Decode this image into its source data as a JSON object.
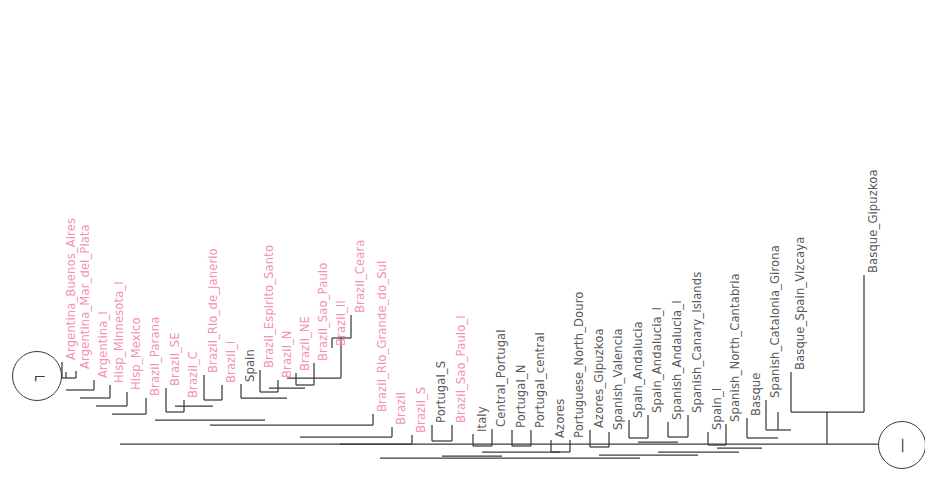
{
  "figure": {
    "orientation": "rotated-90",
    "background_color": "#ffffff",
    "branch_color": "#3a3a3a",
    "colors": {
      "clade_pink": "#f58fb4",
      "clade_grey": "#58585a",
      "branch": "#3a3a3a",
      "badge_border": "#3a3a3a"
    }
  },
  "node_badges": [
    {
      "name": "badge-left",
      "label": "┐",
      "cx": 36,
      "cy": 375,
      "r": 24
    },
    {
      "name": "badge-right",
      "label": "—",
      "cx": 901,
      "cy": 444,
      "r": 23
    }
  ],
  "tips": [
    {
      "label": "Argentina_Buenos_Aires",
      "color": "pink",
      "x": 62,
      "y": 362,
      "tip_len": 18
    },
    {
      "label": "Argentina_Mar_del_Plata",
      "color": "pink",
      "x": 76,
      "y": 371,
      "tip_len": 14
    },
    {
      "label": "Argentina_I",
      "color": "pink",
      "x": 94,
      "y": 380,
      "tip_len": 12
    },
    {
      "label": "Hisp_Minnesota_I",
      "color": "pink",
      "x": 110,
      "y": 385,
      "tip_len": 12
    },
    {
      "label": "Hisp_Mexico",
      "color": "pink",
      "x": 127,
      "y": 392,
      "tip_len": 12
    },
    {
      "label": "Brazil_Parana",
      "color": "pink",
      "x": 146,
      "y": 398,
      "tip_len": 12
    },
    {
      "label": "Brazil_SE",
      "color": "pink",
      "x": 166,
      "y": 388,
      "tip_len": 14
    },
    {
      "label": "Brazil_C",
      "color": "pink",
      "x": 184,
      "y": 400,
      "tip_len": 14
    },
    {
      "label": "Brazil_Rio_de_Janerio",
      "color": "pink",
      "x": 204,
      "y": 375,
      "tip_len": 14
    },
    {
      "label": "Brazil_I",
      "color": "pink",
      "x": 222,
      "y": 385,
      "tip_len": 14
    },
    {
      "label": "Spain",
      "color": "grey",
      "x": 241,
      "y": 384,
      "tip_len": 14
    },
    {
      "label": "Brazil_Espirito_Santo",
      "color": "pink",
      "x": 260,
      "y": 370,
      "tip_len": 14
    },
    {
      "label": "Brazil_N",
      "color": "pink",
      "x": 278,
      "y": 380,
      "tip_len": 14
    },
    {
      "label": "Brazil_NE",
      "color": "pink",
      "x": 296,
      "y": 373,
      "tip_len": 14
    },
    {
      "label": "Brazil_Sao_Paulo",
      "color": "pink",
      "x": 314,
      "y": 363,
      "tip_len": 14
    },
    {
      "label": "Brazil_II",
      "color": "pink",
      "x": 332,
      "y": 348,
      "tip_len": 30
    },
    {
      "label": "Brazil_Ceara",
      "color": "pink",
      "x": 351,
      "y": 315,
      "tip_len": 28
    },
    {
      "label": "Brazil_Rio_Grande_do_Sul",
      "color": "pink",
      "x": 373,
      "y": 414,
      "tip_len": 14
    },
    {
      "label": "Brazil",
      "color": "pink",
      "x": 392,
      "y": 427,
      "tip_len": 14
    },
    {
      "label": "Brazil_S",
      "color": "pink",
      "x": 412,
      "y": 435,
      "tip_len": 14
    },
    {
      "label": "Portugal_S",
      "color": "grey",
      "x": 432,
      "y": 425,
      "tip_len": 16
    },
    {
      "label": "Brazil_Sao_Paulo_I",
      "color": "pink",
      "x": 452,
      "y": 425,
      "tip_len": 16
    },
    {
      "label": "Italy",
      "color": "grey",
      "x": 473,
      "y": 434,
      "tip_len": 16
    },
    {
      "label": "Central_Portugal",
      "color": "grey",
      "x": 492,
      "y": 429,
      "tip_len": 16
    },
    {
      "label": "Portugal_N",
      "color": "grey",
      "x": 512,
      "y": 430,
      "tip_len": 16
    },
    {
      "label": "Portugal_central",
      "color": "grey",
      "x": 531,
      "y": 430,
      "tip_len": 16
    },
    {
      "label": "Azores",
      "color": "grey",
      "x": 551,
      "y": 440,
      "tip_len": 12
    },
    {
      "label": "Portuguese_North_Douro",
      "color": "grey",
      "x": 570,
      "y": 440,
      "tip_len": 12
    },
    {
      "label": "Azores_Gipuzkoa",
      "color": "grey",
      "x": 590,
      "y": 430,
      "tip_len": 18
    },
    {
      "label": "Spanish_Valencia",
      "color": "grey",
      "x": 609,
      "y": 432,
      "tip_len": 18
    },
    {
      "label": "Spain_Andalucia",
      "color": "grey",
      "x": 629,
      "y": 420,
      "tip_len": 18
    },
    {
      "label": "Spain_Andalucia_I",
      "color": "grey",
      "x": 648,
      "y": 415,
      "tip_len": 18
    },
    {
      "label": "Spanish_Andalucia_I",
      "color": "grey",
      "x": 668,
      "y": 422,
      "tip_len": 18
    },
    {
      "label": "Spanish_Canary_Islands",
      "color": "grey",
      "x": 688,
      "y": 415,
      "tip_len": 18
    },
    {
      "label": "Spain_I",
      "color": "grey",
      "x": 708,
      "y": 432,
      "tip_len": 18
    },
    {
      "label": "Spanish_North_Cantabria",
      "color": "grey",
      "x": 726,
      "y": 424,
      "tip_len": 18
    },
    {
      "label": "Basque",
      "color": "grey",
      "x": 747,
      "y": 418,
      "tip_len": 22
    },
    {
      "label": "Spanish_Catalonia_Girona",
      "color": "grey",
      "x": 766,
      "y": 400,
      "tip_len": 28
    },
    {
      "label": "Basque_Spain_Vizcaya",
      "color": "grey",
      "x": 791,
      "y": 372,
      "tip_len": 32
    },
    {
      "label": "Basque_Gipuzkoa",
      "color": "grey",
      "x": 864,
      "y": 275,
      "tip_len": 38
    }
  ],
  "branch_segments": [
    {
      "name": "tip-stem-0",
      "x1": 62,
      "y1": 362,
      "x2": 62,
      "y2": 378
    },
    {
      "name": "tip-stem-1",
      "x1": 76,
      "y1": 371,
      "x2": 76,
      "y2": 378
    },
    {
      "name": "hbar-a1",
      "x1": 62,
      "y1": 378,
      "x2": 76,
      "y2": 378
    },
    {
      "name": "vstem-a1",
      "x1": 66,
      "y1": 378,
      "x2": 66,
      "y2": 372
    },
    {
      "name": "tip-stem-2",
      "x1": 94,
      "y1": 380,
      "x2": 94,
      "y2": 390
    },
    {
      "name": "hbar-a2",
      "x1": 66,
      "y1": 390,
      "x2": 94,
      "y2": 390
    },
    {
      "name": "tip-stem-3",
      "x1": 110,
      "y1": 385,
      "x2": 110,
      "y2": 398
    },
    {
      "name": "hbar-a3",
      "x1": 80,
      "y1": 398,
      "x2": 110,
      "y2": 398
    },
    {
      "name": "tip-stem-4",
      "x1": 127,
      "y1": 392,
      "x2": 127,
      "y2": 406
    },
    {
      "name": "hbar-a4",
      "x1": 96,
      "y1": 406,
      "x2": 127,
      "y2": 406
    },
    {
      "name": "tip-stem-5",
      "x1": 146,
      "y1": 398,
      "x2": 146,
      "y2": 414
    },
    {
      "name": "hbar-a5",
      "x1": 112,
      "y1": 414,
      "x2": 146,
      "y2": 414
    },
    {
      "name": "tip-stem-6",
      "x1": 166,
      "y1": 388,
      "x2": 166,
      "y2": 412
    },
    {
      "name": "tip-stem-7",
      "x1": 184,
      "y1": 400,
      "x2": 184,
      "y2": 412
    },
    {
      "name": "hbar-b1",
      "x1": 166,
      "y1": 412,
      "x2": 184,
      "y2": 412
    },
    {
      "name": "tip-stem-8",
      "x1": 204,
      "y1": 375,
      "x2": 204,
      "y2": 400
    },
    {
      "name": "tip-stem-9",
      "x1": 222,
      "y1": 385,
      "x2": 222,
      "y2": 400
    },
    {
      "name": "hbar-b2",
      "x1": 204,
      "y1": 400,
      "x2": 222,
      "y2": 400
    },
    {
      "name": "link-b12",
      "x1": 175,
      "y1": 406,
      "x2": 213,
      "y2": 406
    },
    {
      "name": "tip-stem-10",
      "x1": 241,
      "y1": 384,
      "x2": 241,
      "y2": 398
    },
    {
      "name": "tip-stem-11",
      "x1": 260,
      "y1": 370,
      "x2": 260,
      "y2": 392
    },
    {
      "name": "tip-stem-12",
      "x1": 278,
      "y1": 380,
      "x2": 278,
      "y2": 392
    },
    {
      "name": "hbar-c1",
      "x1": 260,
      "y1": 392,
      "x2": 278,
      "y2": 392
    },
    {
      "name": "tip-stem-13",
      "x1": 296,
      "y1": 373,
      "x2": 296,
      "y2": 385
    },
    {
      "name": "tip-stem-14",
      "x1": 314,
      "y1": 363,
      "x2": 314,
      "y2": 385
    },
    {
      "name": "hbar-c2",
      "x1": 296,
      "y1": 385,
      "x2": 314,
      "y2": 385
    },
    {
      "name": "link-c12",
      "x1": 269,
      "y1": 388,
      "x2": 305,
      "y2": 388
    },
    {
      "name": "tip-stem-15",
      "x1": 332,
      "y1": 348,
      "x2": 332,
      "y2": 338
    },
    {
      "name": "tip-stem-16",
      "x1": 351,
      "y1": 315,
      "x2": 351,
      "y2": 338
    },
    {
      "name": "hbar-d1",
      "x1": 332,
      "y1": 338,
      "x2": 351,
      "y2": 338
    },
    {
      "name": "dstem",
      "x1": 341,
      "y1": 338,
      "x2": 341,
      "y2": 378
    },
    {
      "name": "hbar-d2",
      "x1": 287,
      "y1": 378,
      "x2": 341,
      "y2": 378
    },
    {
      "name": "link-spain",
      "x1": 241,
      "y1": 398,
      "x2": 287,
      "y2": 398
    },
    {
      "name": "deep-1",
      "x1": 155,
      "y1": 420,
      "x2": 265,
      "y2": 420
    },
    {
      "name": "tip-stem-17",
      "x1": 373,
      "y1": 414,
      "x2": 373,
      "y2": 425
    },
    {
      "name": "hbar-e1",
      "x1": 210,
      "y1": 425,
      "x2": 373,
      "y2": 425
    },
    {
      "name": "tip-stem-18",
      "x1": 392,
      "y1": 427,
      "x2": 392,
      "y2": 437
    },
    {
      "name": "tip-stem-19",
      "x1": 412,
      "y1": 435,
      "x2": 412,
      "y2": 444
    },
    {
      "name": "hbar-e2",
      "x1": 300,
      "y1": 437,
      "x2": 392,
      "y2": 437
    },
    {
      "name": "hbar-e3",
      "x1": 340,
      "y1": 444,
      "x2": 412,
      "y2": 444
    },
    {
      "name": "tip-stem-20",
      "x1": 432,
      "y1": 425,
      "x2": 432,
      "y2": 441
    },
    {
      "name": "tip-stem-21",
      "x1": 452,
      "y1": 425,
      "x2": 452,
      "y2": 441
    },
    {
      "name": "hbar-f1",
      "x1": 432,
      "y1": 441,
      "x2": 452,
      "y2": 441
    },
    {
      "name": "tip-stem-22",
      "x1": 473,
      "y1": 434,
      "x2": 473,
      "y2": 446
    },
    {
      "name": "tip-stem-23",
      "x1": 492,
      "y1": 429,
      "x2": 492,
      "y2": 446
    },
    {
      "name": "hbar-f2",
      "x1": 473,
      "y1": 446,
      "x2": 492,
      "y2": 446
    },
    {
      "name": "tip-stem-24",
      "x1": 512,
      "y1": 430,
      "x2": 512,
      "y2": 446
    },
    {
      "name": "tip-stem-25",
      "x1": 531,
      "y1": 430,
      "x2": 531,
      "y2": 446
    },
    {
      "name": "hbar-f3",
      "x1": 512,
      "y1": 446,
      "x2": 531,
      "y2": 446
    },
    {
      "name": "tip-stem-26",
      "x1": 551,
      "y1": 440,
      "x2": 551,
      "y2": 452
    },
    {
      "name": "tip-stem-27",
      "x1": 570,
      "y1": 440,
      "x2": 570,
      "y2": 452
    },
    {
      "name": "tip-stem-28",
      "x1": 590,
      "y1": 430,
      "x2": 590,
      "y2": 447
    },
    {
      "name": "tip-stem-29",
      "x1": 609,
      "y1": 432,
      "x2": 609,
      "y2": 447
    },
    {
      "name": "hbar-g1",
      "x1": 590,
      "y1": 447,
      "x2": 609,
      "y2": 447
    },
    {
      "name": "tip-stem-30",
      "x1": 629,
      "y1": 420,
      "x2": 629,
      "y2": 438
    },
    {
      "name": "tip-stem-31",
      "x1": 648,
      "y1": 415,
      "x2": 648,
      "y2": 438
    },
    {
      "name": "hbar-g2",
      "x1": 629,
      "y1": 438,
      "x2": 648,
      "y2": 438
    },
    {
      "name": "tip-stem-32",
      "x1": 668,
      "y1": 422,
      "x2": 668,
      "y2": 437
    },
    {
      "name": "tip-stem-33",
      "x1": 688,
      "y1": 415,
      "x2": 688,
      "y2": 437
    },
    {
      "name": "hbar-g3",
      "x1": 668,
      "y1": 437,
      "x2": 688,
      "y2": 437
    },
    {
      "name": "link-g23",
      "x1": 638,
      "y1": 442,
      "x2": 678,
      "y2": 442
    },
    {
      "name": "tip-stem-34",
      "x1": 708,
      "y1": 432,
      "x2": 708,
      "y2": 445
    },
    {
      "name": "tip-stem-35",
      "x1": 726,
      "y1": 424,
      "x2": 726,
      "y2": 445
    },
    {
      "name": "hbar-h1",
      "x1": 708,
      "y1": 445,
      "x2": 726,
      "y2": 445
    },
    {
      "name": "tip-stem-36",
      "x1": 747,
      "y1": 418,
      "x2": 747,
      "y2": 438
    },
    {
      "name": "tip-stem-37",
      "x1": 766,
      "y1": 400,
      "x2": 766,
      "y2": 430
    },
    {
      "name": "tip-stem-38",
      "x1": 791,
      "y1": 372,
      "x2": 791,
      "y2": 412
    },
    {
      "name": "hbar-i1",
      "x1": 766,
      "y1": 430,
      "x2": 791,
      "y2": 430
    },
    {
      "name": "istem",
      "x1": 778,
      "y1": 430,
      "x2": 778,
      "y2": 412
    },
    {
      "name": "hbar-i2",
      "x1": 747,
      "y1": 438,
      "x2": 778,
      "y2": 438
    },
    {
      "name": "hbar-i3",
      "x1": 717,
      "y1": 448,
      "x2": 762,
      "y2": 448
    },
    {
      "name": "hbar-g4",
      "x1": 658,
      "y1": 452,
      "x2": 739,
      "y2": 452
    },
    {
      "name": "hbar-spanish",
      "x1": 599,
      "y1": 455,
      "x2": 698,
      "y2": 455
    },
    {
      "name": "hbar-azores",
      "x1": 551,
      "y1": 452,
      "x2": 570,
      "y2": 452
    },
    {
      "name": "hbar-portcluster",
      "x1": 521,
      "y1": 452,
      "x2": 560,
      "y2": 452
    },
    {
      "name": "hbar-italyport",
      "x1": 482,
      "y1": 452,
      "x2": 521,
      "y2": 452
    },
    {
      "name": "hbar-pfam",
      "x1": 442,
      "y1": 456,
      "x2": 502,
      "y2": 456
    },
    {
      "name": "backbone-mid",
      "x1": 380,
      "y1": 458,
      "x2": 640,
      "y2": 458
    },
    {
      "name": "tip-stem-39",
      "x1": 864,
      "y1": 275,
      "x2": 864,
      "y2": 412
    },
    {
      "name": "hbar-basque",
      "x1": 791,
      "y1": 412,
      "x2": 864,
      "y2": 412
    },
    {
      "name": "basque-stem",
      "x1": 827,
      "y1": 412,
      "x2": 827,
      "y2": 444
    },
    {
      "name": "backbone-root",
      "x1": 120,
      "y1": 444,
      "x2": 878,
      "y2": 444
    }
  ]
}
